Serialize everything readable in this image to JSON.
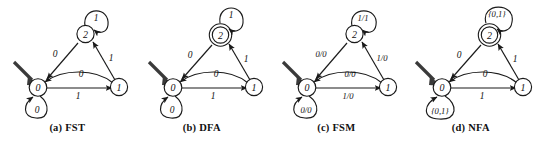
{
  "figure": {
    "background_color": "#ffffff",
    "ink_color": "#1a1a1a",
    "panel_count": 4,
    "panels": [
      {
        "id": "fst",
        "caption_index": "(a)",
        "caption_label": "FST",
        "accepting_state_double_circle": false,
        "states": [
          {
            "name": "state-0",
            "label": "0",
            "initial": true,
            "accepting": false
          },
          {
            "name": "state-1",
            "label": "1",
            "initial": false,
            "accepting": false
          },
          {
            "name": "state-2",
            "label": "2",
            "initial": false,
            "accepting": false
          }
        ],
        "transitions": [
          {
            "name": "self-loop-state-2",
            "from": "2",
            "to": "2",
            "label": "1"
          },
          {
            "name": "edge-2-to-0",
            "from": "2",
            "to": "0",
            "label": "0"
          },
          {
            "name": "edge-1-to-2",
            "from": "1",
            "to": "2",
            "label": "1"
          },
          {
            "name": "edge-1-to-0",
            "from": "1",
            "to": "0",
            "label": "0"
          },
          {
            "name": "edge-0-to-1",
            "from": "0",
            "to": "1",
            "label": "1"
          },
          {
            "name": "self-loop-state-0",
            "from": "0",
            "to": "0",
            "label": "0"
          }
        ]
      },
      {
        "id": "dfa",
        "caption_index": "(b)",
        "caption_label": "DFA",
        "accepting_state_double_circle": true,
        "states": [
          {
            "name": "state-0",
            "label": "0",
            "initial": true,
            "accepting": false
          },
          {
            "name": "state-1",
            "label": "1",
            "initial": false,
            "accepting": false
          },
          {
            "name": "state-2",
            "label": "2",
            "initial": false,
            "accepting": true
          }
        ],
        "transitions": [
          {
            "name": "self-loop-state-2",
            "from": "2",
            "to": "2",
            "label": "1"
          },
          {
            "name": "edge-2-to-0",
            "from": "2",
            "to": "0",
            "label": "0"
          },
          {
            "name": "edge-1-to-2",
            "from": "1",
            "to": "2",
            "label": "1"
          },
          {
            "name": "edge-1-to-0",
            "from": "1",
            "to": "0",
            "label": "0"
          },
          {
            "name": "edge-0-to-1",
            "from": "0",
            "to": "1",
            "label": "1"
          },
          {
            "name": "self-loop-state-0",
            "from": "0",
            "to": "0",
            "label": "0"
          }
        ]
      },
      {
        "id": "fsm",
        "caption_index": "(c)",
        "caption_label": "FSM",
        "accepting_state_double_circle": false,
        "states": [
          {
            "name": "state-0",
            "label": "0",
            "initial": true,
            "accepting": false
          },
          {
            "name": "state-1",
            "label": "1",
            "initial": false,
            "accepting": false
          },
          {
            "name": "state-2",
            "label": "2",
            "initial": false,
            "accepting": false
          }
        ],
        "transitions": [
          {
            "name": "self-loop-state-2",
            "from": "2",
            "to": "2",
            "label": "1/1"
          },
          {
            "name": "edge-2-to-0",
            "from": "2",
            "to": "0",
            "label": "0/0"
          },
          {
            "name": "edge-1-to-2",
            "from": "1",
            "to": "2",
            "label": "1/0"
          },
          {
            "name": "edge-1-to-0",
            "from": "1",
            "to": "0",
            "label": "0/0"
          },
          {
            "name": "edge-0-to-1",
            "from": "0",
            "to": "1",
            "label": "1/0"
          },
          {
            "name": "self-loop-state-0",
            "from": "0",
            "to": "0",
            "label": "0/0"
          }
        ]
      },
      {
        "id": "nfa",
        "caption_index": "(d)",
        "caption_label": "NFA",
        "accepting_state_double_circle": true,
        "states": [
          {
            "name": "state-0",
            "label": "0",
            "initial": true,
            "accepting": false
          },
          {
            "name": "state-1",
            "label": "1",
            "initial": false,
            "accepting": false
          },
          {
            "name": "state-2",
            "label": "2",
            "initial": false,
            "accepting": true
          }
        ],
        "transitions": [
          {
            "name": "self-loop-state-2",
            "from": "2",
            "to": "2",
            "label": "{0,1}"
          },
          {
            "name": "edge-2-to-0",
            "from": "2",
            "to": "0",
            "label": "0"
          },
          {
            "name": "edge-1-to-2",
            "from": "1",
            "to": "2",
            "label": "1"
          },
          {
            "name": "edge-1-to-0",
            "from": "1",
            "to": "0",
            "label": "0"
          },
          {
            "name": "edge-0-to-1",
            "from": "0",
            "to": "1",
            "label": "1"
          },
          {
            "name": "self-loop-state-0",
            "from": "0",
            "to": "0",
            "label": "{0,1}"
          }
        ]
      }
    ]
  }
}
